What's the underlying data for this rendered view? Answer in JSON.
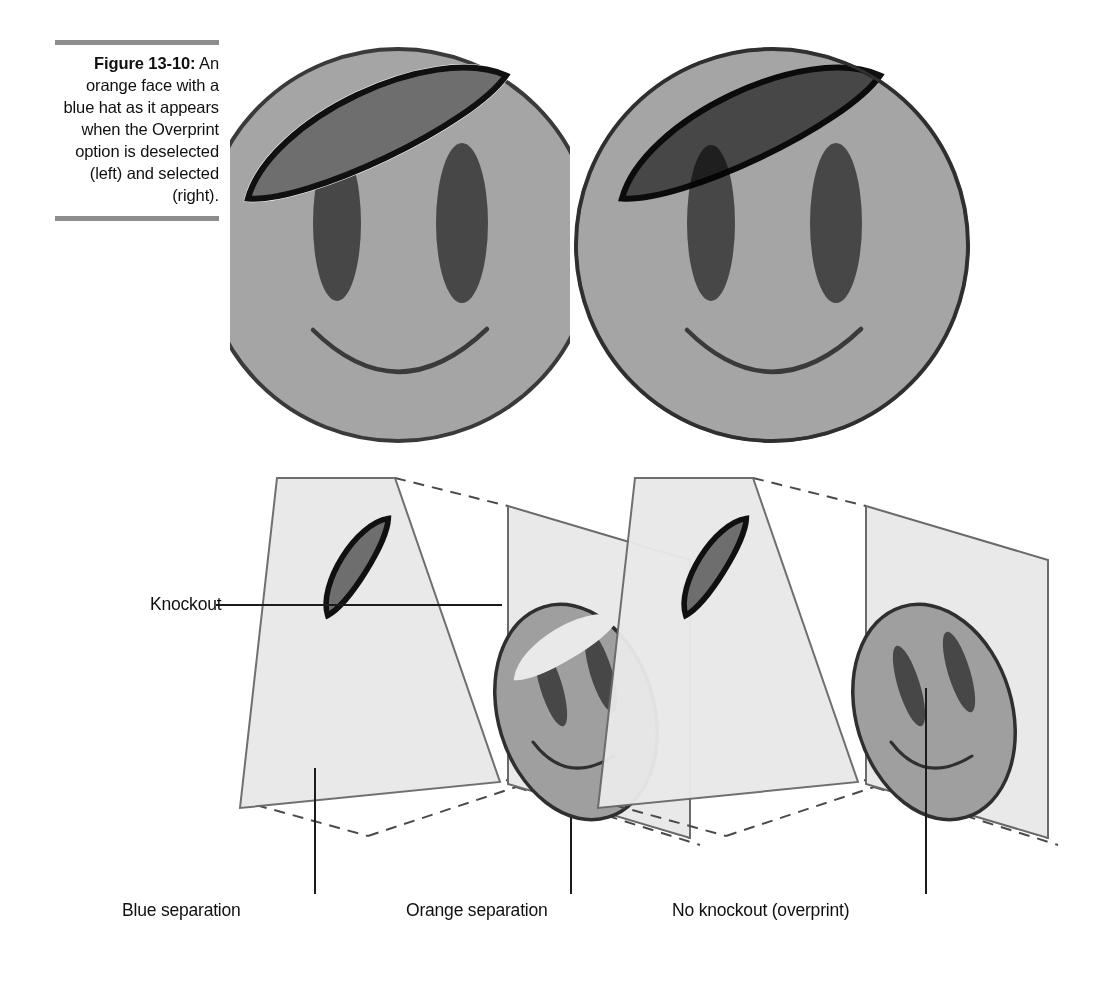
{
  "figure": {
    "number": "Figure 13-10:",
    "caption_lines": [
      "An orange face",
      "with a blue hat",
      "as it appears",
      "when the",
      "Overprint",
      "option is",
      "deselected (left)",
      "and selected",
      "(right)."
    ],
    "caption_full": "Figure 13-10: An orange face with a blue hat as it appears when the Overprint option is deselected (left) and selected (right)."
  },
  "callouts": {
    "knockout": "Knockout",
    "blue_separation": "Blue separation",
    "orange_separation": "Orange separation",
    "no_knockout": "No knockout (overprint)"
  },
  "colors": {
    "page_background": "#ffffff",
    "rule_gray": "#8d8d8d",
    "face_fill": "#a5a5a5",
    "hat_fill": "#6e6e6e",
    "overlap_fill": "#4e4e4e",
    "eye_fill": "#474747",
    "outline": "#1b1b1b",
    "plane_fill": "#e9e9e9",
    "plane_stroke": "#6a6a6a",
    "text": "#101010"
  },
  "panels": [
    {
      "id": "composite-knockout",
      "position": "top-left",
      "description": "Orange face with blue hat, Overprint deselected (knockout): hat is opaque and hides the face and left eye beneath it.",
      "overprint": false
    },
    {
      "id": "composite-overprint",
      "position": "top-right",
      "description": "Orange face with blue hat, Overprint selected: hat multiplies over the face so the face outline and left eye show through as a darker overlap.",
      "overprint": true
    },
    {
      "id": "separations-knockout",
      "position": "bottom-left",
      "description": "Two separation planes in perspective: blue separation plate carries the hat, orange separation plate carries the face with a knockout bite removed where the hat overlaps.",
      "overprint": false,
      "plates": [
        "Blue separation",
        "Orange separation"
      ]
    },
    {
      "id": "separations-overprint",
      "position": "bottom-right",
      "description": "Two separation planes in perspective: blue separation plate carries the hat, orange separation plate carries the complete face with no knockout.",
      "overprint": true,
      "plates": [
        "No knockout (overprint)"
      ]
    }
  ]
}
